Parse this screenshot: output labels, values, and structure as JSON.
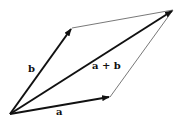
{
  "diagram": {
    "labels": {
      "a": "a",
      "b": "b",
      "sum": "a + b"
    },
    "points": {
      "origin": [
        10,
        114
      ],
      "a": [
        110,
        97
      ],
      "b": [
        72,
        28
      ],
      "sum": [
        173,
        10
      ]
    },
    "colors": {
      "vector": "#111111",
      "guide": "#555555"
    }
  }
}
